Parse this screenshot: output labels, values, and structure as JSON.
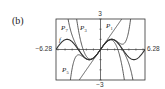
{
  "panel_label": "(b)",
  "chart_data": {
    "type": "line",
    "title": "",
    "xlabel": "",
    "ylabel": "",
    "xlim": [
      -6.28,
      6.28
    ],
    "ylim": [
      -3,
      3
    ],
    "grid": false,
    "tick_labels": {
      "x_min": "−6.28",
      "x_max": "6.28",
      "y_max": "3",
      "y_min": "−3"
    },
    "series": [
      {
        "name": "f",
        "label": "f",
        "function": "sin(x)",
        "coefficients": [
          0,
          1,
          0,
          -0.1666667,
          0,
          0.0083333,
          0,
          -0.000198413
        ]
      },
      {
        "name": "P1",
        "label": "P",
        "subscript": "1",
        "coefficients": [
          0,
          1
        ]
      },
      {
        "name": "P3",
        "label": "P",
        "subscript": "3",
        "coefficients": [
          0,
          1,
          0,
          -0.1666667
        ]
      },
      {
        "name": "P5",
        "label": "P",
        "subscript": "5",
        "coefficients": [
          0,
          1,
          0,
          -0.1666667,
          0,
          0.0083333
        ]
      },
      {
        "name": "P7",
        "label": "P",
        "subscript": "7",
        "coefficients": [
          0,
          1,
          0,
          -0.1666667,
          0,
          0.0083333,
          0,
          -0.000198413
        ]
      }
    ]
  }
}
